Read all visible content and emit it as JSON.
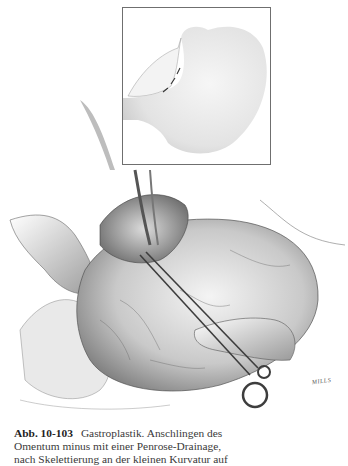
{
  "figure": {
    "label": "Abb. 10-103",
    "inset": {
      "description": "stomach-overview-inset"
    },
    "main_illustration": {
      "description": "surgical-scene-clamp-stomach"
    },
    "signature": "MILLS"
  },
  "caption": {
    "label": "Abb. 10-103",
    "lines": [
      "Gastroplastik. Anschlingen des",
      "Omentum minus mit einer Penrose-Drainage,",
      "nach Skelettierung an der kleinen Kurvatur auf"
    ]
  },
  "colors": {
    "text": "#3a3a3a",
    "label": "#1f1f1f",
    "inset_border": "#6f6f6f",
    "ink": "#4a4a4a"
  }
}
